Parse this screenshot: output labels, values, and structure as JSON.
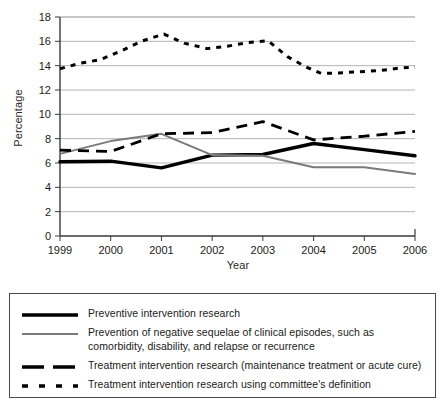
{
  "chart_data": {
    "type": "line",
    "title": "",
    "xlabel": "Year",
    "ylabel": "Percentage",
    "categories": [
      "1999",
      "2000",
      "2001",
      "2002",
      "2003",
      "2004",
      "2005",
      "2006"
    ],
    "x": [
      1999,
      2000,
      2001,
      2002,
      2003,
      2004,
      2005,
      2006
    ],
    "xlim": [
      1999,
      2006
    ],
    "ylim": [
      0,
      18
    ],
    "ytick_step": 2,
    "yticks": [
      "0",
      "2",
      "4",
      "6",
      "8",
      "10",
      "12",
      "14",
      "16",
      "18"
    ],
    "grid": "horizontal",
    "legend_position": "below-plot-boxed",
    "series": [
      {
        "name": "Preventive intervention research",
        "style": "solid-thick-black",
        "color": "#000000",
        "x": [
          1999,
          2000,
          2001,
          2002,
          2003,
          2004,
          2005,
          2006
        ],
        "values": [
          6.1,
          6.15,
          5.6,
          6.65,
          6.7,
          7.6,
          7.1,
          6.6
        ]
      },
      {
        "name": "Prevention of negative sequelae of clinical episodes, such as comorbidity, disability, and relapse or recurrence",
        "style": "solid-gray",
        "color": "#7a7a7a",
        "x": [
          1999,
          2000,
          2001,
          2002,
          2003,
          2004,
          2005,
          2006
        ],
        "values": [
          6.75,
          7.8,
          8.4,
          6.65,
          6.6,
          5.65,
          5.65,
          5.1
        ]
      },
      {
        "name": "Treatment intervention research (maintenance treatment or acute cure)",
        "style": "long-dashed-black",
        "color": "#000000",
        "x": [
          1999,
          2000,
          2001,
          2002,
          2003,
          2004,
          2005,
          2006
        ],
        "values": [
          7.05,
          6.95,
          8.4,
          8.5,
          9.4,
          7.9,
          8.2,
          8.6
        ]
      },
      {
        "name": "Treatment intervention research using committee's definition",
        "style": "short-dotted-black",
        "color": "#000000",
        "x": [
          1999.0,
          1999.4,
          1999.8,
          2000.2,
          2000.6,
          2001.05,
          2001.45,
          2001.9,
          2002.3,
          2002.7,
          2003.1,
          2003.5,
          2003.85,
          2004.15,
          2004.5,
          2004.9,
          2005.3,
          2005.7,
          2006.0
        ],
        "values": [
          13.75,
          14.2,
          14.5,
          15.2,
          16.0,
          16.6,
          15.85,
          15.4,
          15.6,
          15.9,
          16.05,
          14.7,
          13.9,
          13.35,
          13.4,
          13.5,
          13.6,
          13.8,
          13.9
        ]
      }
    ]
  },
  "axes": {
    "ylabel": "Percentage",
    "xlabel": "Year",
    "ytick_labels": [
      "18",
      "16",
      "14",
      "12",
      "10",
      "8",
      "6",
      "4",
      "2",
      "0"
    ],
    "xtick_labels": [
      "1999",
      "2000",
      "2001",
      "2002",
      "2003",
      "2004",
      "2005",
      "2006"
    ]
  },
  "legend": {
    "entries": [
      {
        "label": "Preventive intervention research",
        "swatch": "solid-thick-black-line"
      },
      {
        "label": "Prevention of negative sequelae of clinical episodes, such as comorbidity, disability, and relapse or recurrence",
        "swatch": "solid-gray-line"
      },
      {
        "label": "Treatment intervention research (maintenance treatment or acute cure)",
        "swatch": "long-dashed-black-line"
      },
      {
        "label": "Treatment intervention research using committee's definition",
        "swatch": "short-dotted-black-line"
      }
    ]
  },
  "colors": {
    "series_black": "#000000",
    "series_gray": "#7a7a7a",
    "gridline": "#b5b5b5",
    "axis": "#3a3a3a",
    "legend_border": "#4a4a4a",
    "text": "#1a1a1a",
    "background": "#ffffff"
  }
}
